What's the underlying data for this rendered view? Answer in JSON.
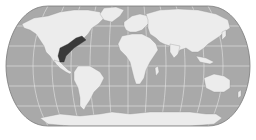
{
  "map": {
    "type": "world-map",
    "projection": "pseudocylindrical (Eckert/Robinson-like)",
    "style": "grayscale",
    "colors": {
      "background": "#ffffff",
      "ocean": "#a9a9a9",
      "land": "#ececec",
      "graticule": "#f4f4f4",
      "border": "#7a7a7a",
      "highlight": "#3a3a3a"
    },
    "graticule": {
      "meridian_count": 12,
      "parallels_count": 6
    },
    "highlighted_regions": [
      {
        "name": "southeastern-north-america",
        "description": "dark shaded region spanning southeastern United States, Gulf of Mexico coast and eastern Mexico"
      }
    ],
    "continents": [
      "North America",
      "South America",
      "Europe",
      "Africa",
      "Asia",
      "Australia",
      "Antarctica",
      "Greenland"
    ]
  }
}
